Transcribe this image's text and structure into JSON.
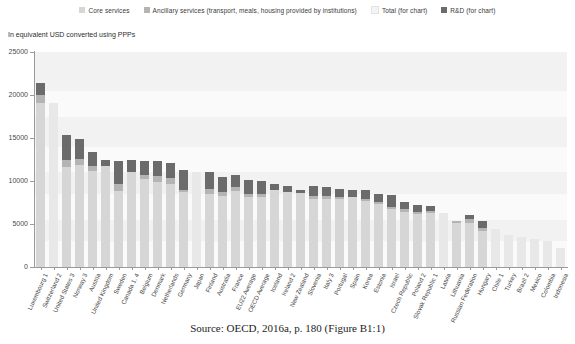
{
  "subtitle": "In equivalent USD converted using PPPs",
  "caption": "Source: OECD, 2016a, p. 180 (Figure B1:1)",
  "legend": [
    {
      "label": "Core services",
      "color": "#d6d6d6"
    },
    {
      "label": "Ancillary services (transport, meals, housing provided by institutions)",
      "color": "#b4b4b4"
    },
    {
      "label": "Total (for chart)",
      "color": "#f2f2f2"
    },
    {
      "label": "R&D (for chart)",
      "color": "#6b6b6b"
    }
  ],
  "colors": {
    "core": "#d6d6d6",
    "ancillary": "#b4b4b4",
    "rd": "#6b6b6b",
    "total": "#f2f2f2",
    "axis": "#9a9a9a",
    "plot_bg": "#fafafa"
  },
  "chart_data": {
    "type": "bar",
    "title": "",
    "subtitle": "In equivalent USD converted using PPPs",
    "xlabel": "",
    "ylabel": "",
    "ylim": [
      0,
      25000
    ],
    "yticks": [
      0,
      5000,
      10000,
      15000,
      20000,
      25000
    ],
    "grid": false,
    "stacked": true,
    "legend_position": "top",
    "series": [
      {
        "name": "Core services",
        "color": "#d6d6d6"
      },
      {
        "name": "Ancillary services",
        "color": "#b4b4b4"
      },
      {
        "name": "R&D",
        "color": "#6b6b6b"
      }
    ],
    "categories": [
      "Luxembourg 1",
      "Switzerland 2",
      "United States 3",
      "Norway 3",
      "Austria",
      "United Kingdom",
      "Sweden",
      "Canada 1, 4",
      "Belgium",
      "Denmark",
      "Netherlands",
      "Germany",
      "Japan",
      "Finland",
      "Australia",
      "France",
      "EU22 Average",
      "OECD Average",
      "Iceland",
      "Ireland 2",
      "New Zealand",
      "Slovenia",
      "Italy 3",
      "Portugal",
      "Spain",
      "Korea",
      "Estonia",
      "Israel",
      "Czech Republic",
      "Poland 2",
      "Slovak Republic 1",
      "Latvia",
      "Lithuania",
      "Russian Federation",
      "Hungary",
      "Chile 1",
      "Turkey",
      "Brazil 2",
      "Mexico",
      "Colombia",
      "Indonesia"
    ],
    "values": {
      "core": [
        19100,
        19100,
        11600,
        11900,
        11200,
        11700,
        8800,
        11000,
        10200,
        9900,
        9700,
        8700,
        11100,
        8500,
        8300,
        8800,
        8100,
        8100,
        8900,
        8700,
        8600,
        7900,
        7900,
        7900,
        8100,
        7700,
        7300,
        6700,
        6400,
        6200,
        6300,
        6300,
        5100,
        5100,
        4200,
        4400,
        3700,
        3500,
        3300,
        3000,
        2200
      ],
      "ancillary": [
        900,
        0,
        800,
        700,
        600,
        0,
        900,
        0,
        500,
        700,
        600,
        300,
        0,
        600,
        400,
        500,
        400,
        400,
        0,
        0,
        0,
        400,
        300,
        200,
        0,
        200,
        300,
        300,
        300,
        200,
        200,
        0,
        300,
        500,
        300,
        0,
        0,
        0,
        0,
        0,
        0
      ],
      "rd": [
        1400,
        0,
        3000,
        2300,
        1600,
        800,
        2600,
        1400,
        1600,
        1700,
        1800,
        2300,
        0,
        2000,
        1800,
        1400,
        1600,
        1500,
        700,
        700,
        400,
        1100,
        1100,
        1000,
        800,
        1000,
        900,
        1400,
        900,
        800,
        600,
        0,
        0,
        500,
        800,
        0,
        0,
        0,
        0,
        0,
        0
      ],
      "total": [
        21400,
        19100,
        15400,
        14900,
        13400,
        12500,
        12300,
        12400,
        12300,
        12300,
        12100,
        11300,
        11100,
        11100,
        10500,
        10700,
        10100,
        10000,
        9600,
        9400,
        9000,
        9400,
        9300,
        9100,
        8900,
        8900,
        8500,
        8400,
        7600,
        7200,
        7100,
        6300,
        5400,
        6100,
        5300,
        4400,
        3700,
        3500,
        3300,
        3000,
        2200
      ]
    }
  }
}
